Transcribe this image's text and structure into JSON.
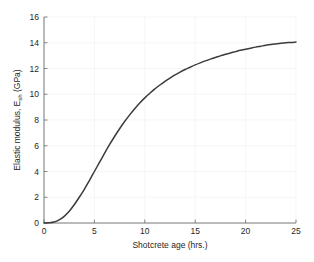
{
  "chart_data": {
    "type": "line",
    "title": "",
    "xlabel": "Shotcrete age (hrs.)",
    "ylabel_main": "Elastic modulus, E",
    "ylabel_sub": "sh",
    "ylabel_tail": " (GPa)",
    "ylabel_full": "Elastic modulus, E_sh (GPa)",
    "xlim": [
      0,
      25
    ],
    "ylim": [
      0,
      16
    ],
    "xticks": [
      0,
      5,
      10,
      15,
      20,
      25
    ],
    "yticks": [
      0,
      2,
      4,
      6,
      8,
      10,
      12,
      14,
      16
    ],
    "xtick_labels": [
      "0",
      "5",
      "10",
      "15",
      "20",
      "25"
    ],
    "ytick_labels": [
      "0",
      "2",
      "4",
      "6",
      "8",
      "10",
      "12",
      "14",
      "16"
    ],
    "grid": true,
    "legend": null,
    "series": [
      {
        "name": "Elastic modulus development",
        "color": "#3b3b3b",
        "x": [
          0,
          0.5,
          1,
          1.5,
          2,
          2.5,
          3,
          3.5,
          4,
          4.5,
          5,
          5.5,
          6,
          6.5,
          7,
          7.5,
          8,
          8.5,
          9,
          9.5,
          10,
          10.5,
          11,
          11.5,
          12,
          12.5,
          13,
          13.5,
          14,
          14.5,
          15,
          15.5,
          16,
          16.5,
          17,
          17.5,
          18,
          18.5,
          19,
          19.5,
          20,
          20.5,
          21,
          21.5,
          22,
          22.5,
          23,
          23.5,
          24,
          24.5,
          25
        ],
        "y": [
          0.0,
          0.02,
          0.08,
          0.24,
          0.52,
          0.92,
          1.42,
          2.0,
          2.62,
          3.3,
          4.0,
          4.7,
          5.4,
          6.08,
          6.72,
          7.32,
          7.88,
          8.4,
          8.88,
          9.32,
          9.72,
          10.08,
          10.42,
          10.72,
          11.0,
          11.26,
          11.5,
          11.72,
          11.92,
          12.1,
          12.28,
          12.44,
          12.59,
          12.73,
          12.86,
          12.98,
          13.1,
          13.21,
          13.31,
          13.41,
          13.5,
          13.58,
          13.66,
          13.73,
          13.8,
          13.86,
          13.91,
          13.96,
          14.0,
          14.02,
          14.05
        ]
      }
    ]
  },
  "layout": {
    "plot_left": 44,
    "plot_top": 17,
    "plot_right": 296,
    "plot_bottom": 223,
    "background_color": "#ffffff",
    "axis_color": "#6b6b6b",
    "grid_color": "#f2f2f2",
    "text_color": "#262626"
  }
}
